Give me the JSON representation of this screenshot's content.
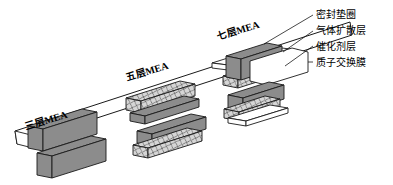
{
  "figure": {
    "type": "exploded-assembly-diagram",
    "background_color": "#ffffff",
    "line_color": "#000000"
  },
  "stacks": [
    {
      "id": "three-layer",
      "label": "三层MEA",
      "layer_count": 3,
      "components": [
        "催化剂层",
        "质子交换膜",
        "催化剂层"
      ]
    },
    {
      "id": "five-layer",
      "label": "五层MEA",
      "layer_count": 5,
      "components": [
        "气体扩散层",
        "催化剂层",
        "质子交换膜",
        "催化剂层",
        "气体扩散层"
      ]
    },
    {
      "id": "seven-layer",
      "label": "七层MEA",
      "layer_count": 7,
      "components": [
        "密封垫圈",
        "气体扩散层",
        "催化剂层",
        "质子交换膜",
        "催化剂层",
        "气体扩散层",
        "密封垫圈"
      ]
    }
  ],
  "callouts": [
    {
      "id": "gasket",
      "label": "密封垫圈",
      "fill": "#ffffff",
      "pattern": "solid"
    },
    {
      "id": "gdl",
      "label": "气体扩散层",
      "fill": "#d9d9d9",
      "pattern": "crosshatch"
    },
    {
      "id": "catalyst",
      "label": "催化剂层",
      "fill": "#8c8c8c",
      "pattern": "solid"
    },
    {
      "id": "membrane",
      "label": "质子交换膜",
      "fill": "#ffffff",
      "pattern": "solid"
    }
  ],
  "colors": {
    "catalyst_gray": "#8c8c8c",
    "gdl_gray": "#d9d9d9",
    "membrane_white": "#ffffff",
    "gasket_white": "#ffffff",
    "outline": "#1a1a1a"
  }
}
